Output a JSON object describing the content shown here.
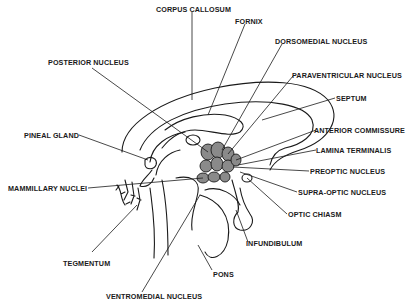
{
  "diagram": {
    "colors": {
      "ink": "#1a1a1a",
      "nucleus_fill": "#8a8a8a",
      "background": "#ffffff"
    },
    "labels": {
      "corpus_callosum": "CORPUS CALLOSUM",
      "fornix": "FORNIX",
      "dorsomedial_nucleus": "DORSOMEDIAL NUCLEUS",
      "posterior_nucleus": "POSTERIOR NUCLEUS",
      "paraventricular_nucleus": "PARAVENTRICULAR NUCLEUS",
      "septum": "SEPTUM",
      "pineal_gland": "PINEAL GLAND",
      "anterior_commissure": "ANTERIOR COMMISSURE",
      "lamina_terminalis": "LAMINA TERMINALIS",
      "mammillary_nuclei": "MAMMILLARY NUCLEI",
      "preoptic_nucleus": "PREOPTIC NUCLEUS",
      "supra_optic_nucleus": "SUPRA-OPTIC NUCLEUS",
      "optic_chiasm": "OPTIC CHIASM",
      "infundibulum": "INFUNDIBULUM",
      "tegmentum": "TEGMENTUM",
      "pons": "PONS",
      "ventromedial_nucleus": "VENTROMEDIAL NUCLEUS"
    }
  }
}
